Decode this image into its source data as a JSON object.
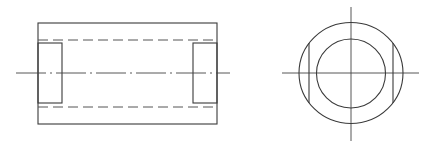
{
  "drawing": {
    "title": "Cylindrical sleeve with two flat chord cuts - orthographic views",
    "colors": {
      "line": "#3a3a3a",
      "background": "#ffffff"
    },
    "front_view": {
      "outer_rect": {
        "x": 38,
        "y": 23,
        "w": 179,
        "h": 101
      },
      "hidden_bore_lines": [
        {
          "y": 40,
          "x1": 38,
          "x2": 217
        },
        {
          "y": 107,
          "x1": 38,
          "x2": 217
        }
      ],
      "left_flat": {
        "x": 38,
        "y": 43,
        "w": 24,
        "h": 60
      },
      "right_flat": {
        "x": 193,
        "y": 43,
        "w": 24,
        "h": 60
      },
      "centerline": {
        "y": 73,
        "x1": 16,
        "x2": 230
      }
    },
    "side_view": {
      "center": {
        "x": 351,
        "y": 73
      },
      "outer_circle_r": 51,
      "inner_circle_r": 34,
      "chord_left_x": 309,
      "chord_right_x": 393,
      "chord_y1": 43,
      "chord_y2": 103,
      "h_centerline": {
        "x1": 282,
        "x2": 419
      },
      "v_centerline": {
        "y1": 7,
        "y2": 141
      }
    }
  }
}
